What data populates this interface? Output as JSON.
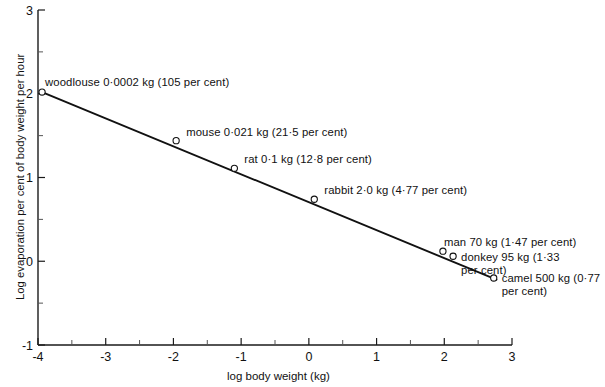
{
  "chart_data": {
    "type": "scatter",
    "title": "",
    "xlabel": "log body weight (kg)",
    "ylabel": "Log evaporation per cent of body weight per hour",
    "xlim": [
      -4,
      3
    ],
    "ylim": [
      -1,
      3
    ],
    "grid": false,
    "legend": "none",
    "x_ticks": [
      "-4",
      "-3",
      "-2",
      "-1",
      "0",
      "1",
      "2",
      "3"
    ],
    "x_tick_values": [
      -4,
      -3,
      -2,
      -1,
      0,
      1,
      2,
      3
    ],
    "x_minor_ticks": [
      -3.5,
      -2.5,
      -1.5,
      -0.5,
      0.5,
      1.5,
      2.5
    ],
    "y_ticks": [
      "-1",
      "0",
      "1",
      "2",
      "3"
    ],
    "y_tick_values": [
      -1,
      0,
      1,
      2,
      3
    ],
    "y_minor_ticks": [
      -0.5,
      0.5,
      1.5,
      2.5
    ],
    "points": [
      {
        "name": "woodlouse",
        "x": -3.94,
        "y": 2.02,
        "mass": "0·0002 kg",
        "percent": "105 per cent",
        "label": "woodlouse 0·0002 kg (105 per cent)"
      },
      {
        "name": "mouse",
        "x": -1.96,
        "y": 1.44,
        "mass": "0·021 kg",
        "percent": "21·5 per cent",
        "label": "mouse 0·021 kg (21·5 per cent)"
      },
      {
        "name": "rat",
        "x": -1.1,
        "y": 1.11,
        "mass": "0·1 kg",
        "percent": "12·8 per cent",
        "label": "rat 0·1 kg (12·8 per cent)"
      },
      {
        "name": "rabbit",
        "x": 0.08,
        "y": 0.74,
        "mass": "2·0 kg",
        "percent": "4·77 per cent",
        "label": "rabbit 2·0 kg (4·77 per cent)"
      },
      {
        "name": "man",
        "x": 1.98,
        "y": 0.12,
        "mass": "70 kg",
        "percent": "1·47 per cent",
        "label": "man 70 kg (1·47 per cent)"
      },
      {
        "name": "donkey",
        "x": 2.13,
        "y": 0.06,
        "mass": "95 kg",
        "percent": "1·33 per cent",
        "label": "donkey 95 kg (1·33 per cent)"
      },
      {
        "name": "camel",
        "x": 2.73,
        "y": -0.2,
        "mass": "500 kg",
        "percent": "0·77 per cent",
        "label": "camel 500 kg (0·77 per cent)"
      }
    ],
    "trendline": {
      "x_start": -3.94,
      "y_start": 2.02,
      "x_end": 2.77,
      "y_end": -0.22
    }
  }
}
